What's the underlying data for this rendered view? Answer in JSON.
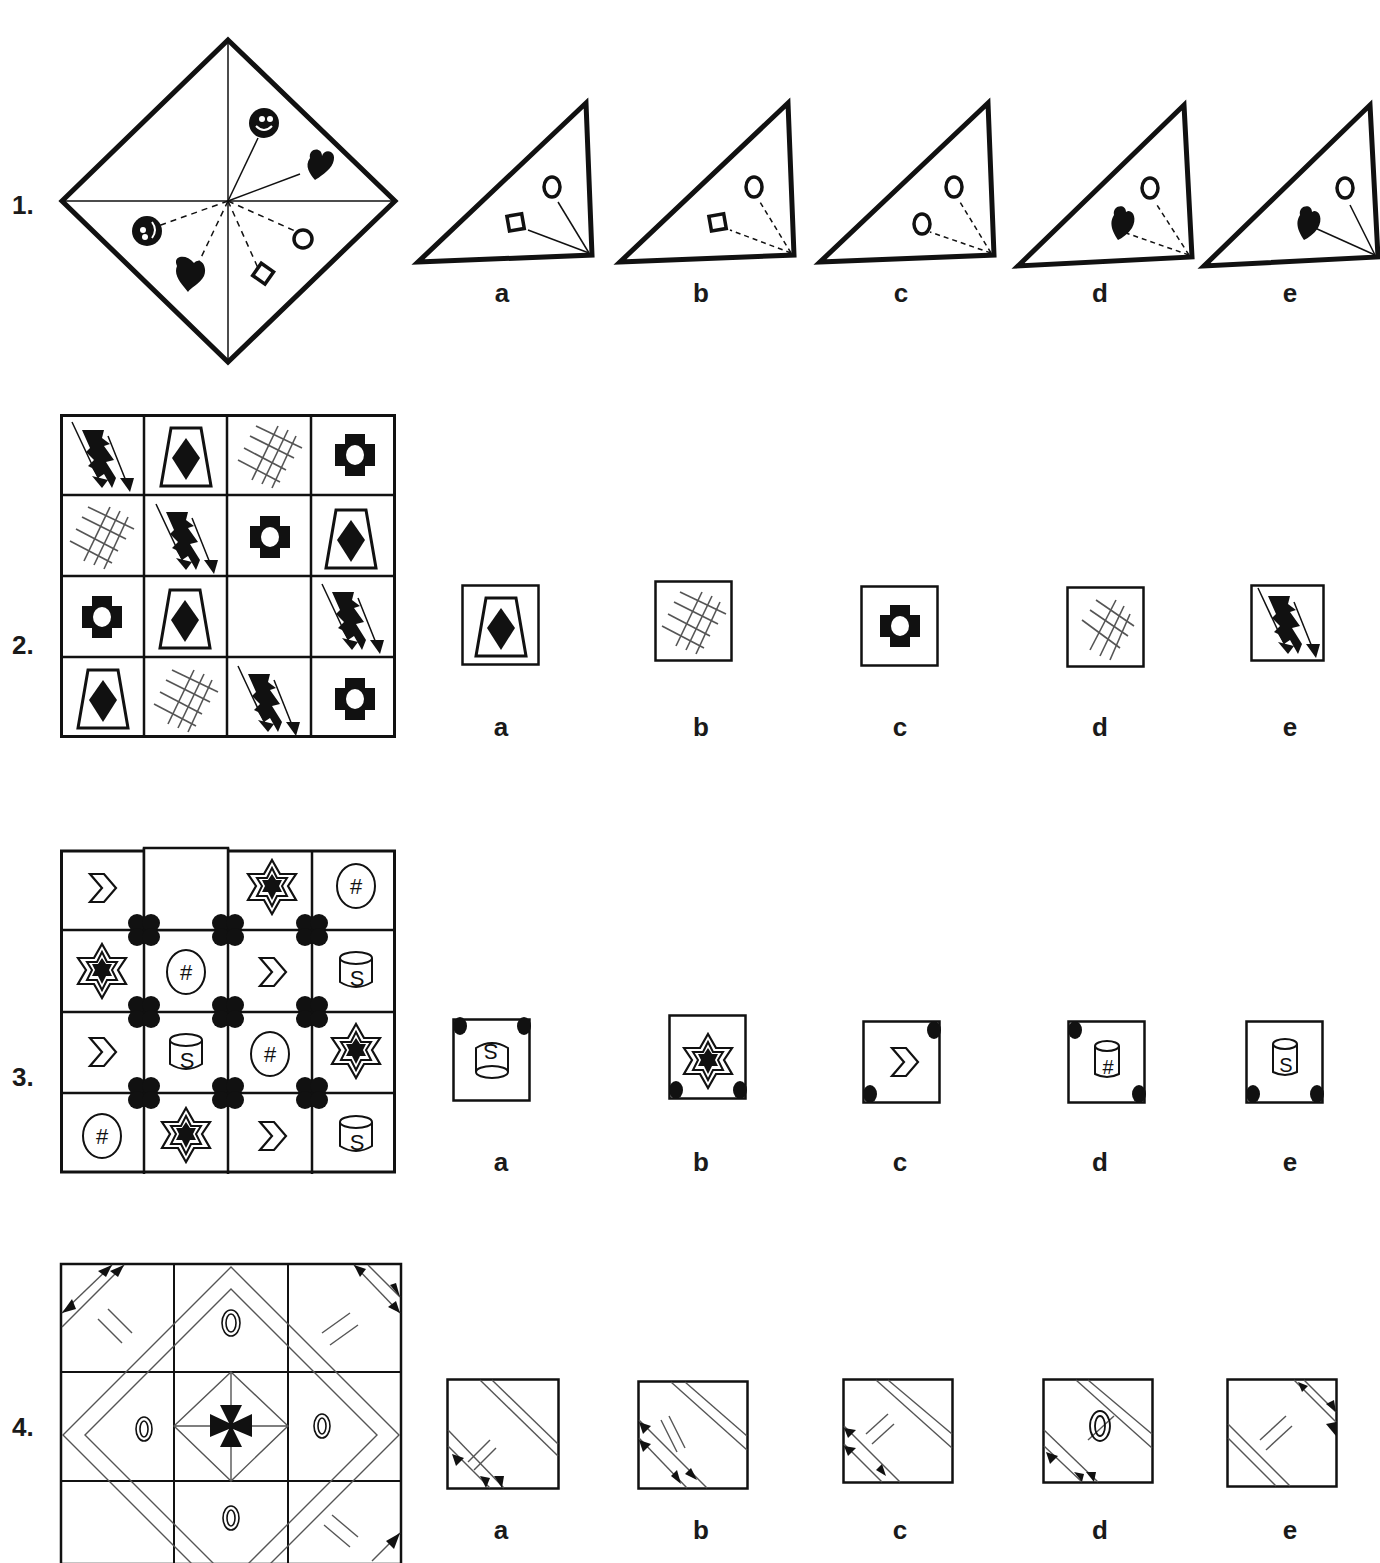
{
  "questions": [
    {
      "number": "1.",
      "type": "folded-square",
      "stem_description": "Diamond (square rotated 45°) split into 4 triangles by both diagonals; pins radiate from the centre: smiley face and black heart on solid lines (upper-right); smiley, black heart, diamond and circle on dashed lines (lower half)",
      "options": [
        {
          "label": "a",
          "description": "Triangle with circle and square on solid lines"
        },
        {
          "label": "b",
          "description": "Triangle with circle and square on dashed lines"
        },
        {
          "label": "c",
          "description": "Triangle with two circles on dashed lines"
        },
        {
          "label": "d",
          "description": "Triangle with circle and black heart on dashed lines"
        },
        {
          "label": "e",
          "description": "Triangle with circle and black heart on solid lines"
        }
      ]
    },
    {
      "number": "2.",
      "type": "grid-4x4",
      "grid": [
        [
          "lightning",
          "trapezoid-diamond",
          "crosshatch",
          "cross-ring"
        ],
        [
          "crosshatch",
          "lightning",
          "cross-ring",
          "trapezoid-diamond"
        ],
        [
          "cross-ring",
          "trapezoid-diamond",
          "",
          "lightning"
        ],
        [
          "trapezoid-diamond",
          "crosshatch",
          "lightning",
          "cross-ring"
        ]
      ],
      "missing_cell": [
        2,
        2
      ],
      "options": [
        {
          "label": "a",
          "symbol": "trapezoid-diamond"
        },
        {
          "label": "b",
          "symbol": "crosshatch"
        },
        {
          "label": "c",
          "symbol": "cross-ring"
        },
        {
          "label": "d",
          "symbol": "crosshatch-sparse"
        },
        {
          "label": "e",
          "symbol": "lightning"
        }
      ]
    },
    {
      "number": "3.",
      "type": "grid-4x4",
      "grid": [
        [
          "chevron",
          "",
          "star",
          "hash-oval"
        ],
        [
          "star",
          "hash-oval",
          "chevron",
          "cylinder-s"
        ],
        [
          "chevron",
          "cylinder-s",
          "hash-oval",
          "star"
        ],
        [
          "hash-oval",
          "star",
          "chevron",
          "cylinder-s"
        ]
      ],
      "missing_cell": [
        0,
        1
      ],
      "corner_dots": "four black circle clusters at interior grid intersections",
      "options": [
        {
          "label": "a",
          "symbol": "cylinder-s-inverted",
          "dots": [
            "top-left",
            "top-right"
          ]
        },
        {
          "label": "b",
          "symbol": "star",
          "dots": [
            "bottom-left",
            "bottom-right"
          ]
        },
        {
          "label": "c",
          "symbol": "chevron",
          "dots": [
            "top-right",
            "bottom-left"
          ]
        },
        {
          "label": "d",
          "symbol": "cylinder-hash",
          "dots": [
            "top-left",
            "bottom-right"
          ]
        },
        {
          "label": "e",
          "symbol": "cylinder-s",
          "dots": [
            "bottom-left",
            "bottom-right"
          ]
        }
      ]
    },
    {
      "number": "4.",
      "type": "grid-3x3",
      "stem_description": "Concentric diamonds centred on a Maltese cross; double-ring ovals at edge midpoints; double-headed arrows in the corners; bottom-left cell missing",
      "missing_cell": [
        2,
        0
      ],
      "options": [
        {
          "label": "a",
          "description": "Arrows lower-left, ticks mid, stripes upper-right"
        },
        {
          "label": "b",
          "description": "Arrows lower-left (left edge), ticks mid, stripes upper-right"
        },
        {
          "label": "c",
          "description": "Arrows left edge, ticks mid, stripes upper-right"
        },
        {
          "label": "d",
          "description": "Arrows lower-left, double oval mid, stripes upper-right"
        },
        {
          "label": "e",
          "description": "Arrows upper-right, ticks mid, stripes lower-left"
        }
      ]
    }
  ],
  "colors": {
    "ink": "#111111",
    "line_gray": "#555555",
    "background": "#ffffff"
  }
}
